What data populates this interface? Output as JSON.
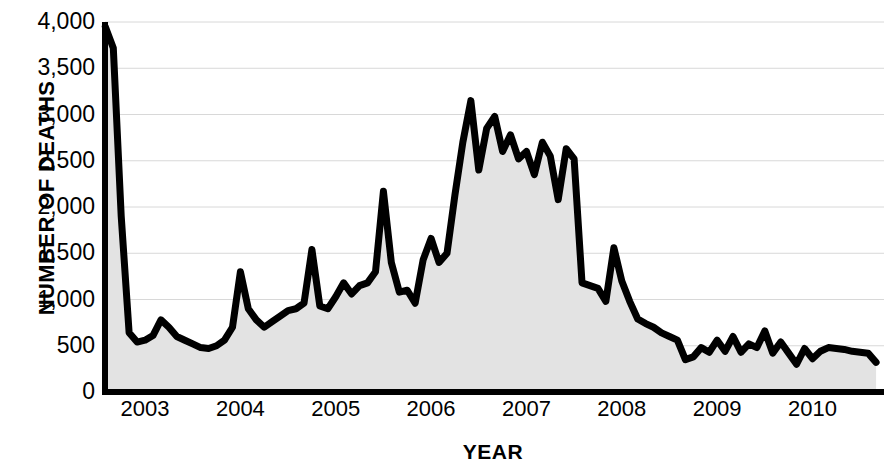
{
  "chart_data": {
    "type": "area",
    "title": "",
    "xlabel": "YEAR",
    "ylabel": "NUMBER OF DEATHS",
    "xlim": [
      2002.58,
      2010.75
    ],
    "ylim": [
      0,
      4000
    ],
    "yticks": [
      0,
      500,
      1000,
      1500,
      2000,
      2500,
      3000,
      3500,
      4000
    ],
    "ytick_labels": [
      "0",
      "500",
      "1,000",
      "1,500",
      "2,000",
      "2,500",
      "3,000",
      "3,500",
      "4,000"
    ],
    "xticks": [
      2003,
      2004,
      2005,
      2006,
      2007,
      2008,
      2009,
      2010
    ],
    "xtick_labels": [
      "2003",
      "2004",
      "2005",
      "2006",
      "2007",
      "2008",
      "2009",
      "2010"
    ],
    "grid": "horizontal",
    "line_color": "#000000",
    "fill_color": "#e3e3e3",
    "line_width": 7,
    "series": [
      {
        "name": "Number of deaths",
        "x": [
          2002.583,
          2002.667,
          2002.75,
          2002.833,
          2002.917,
          2003.0,
          2003.083,
          2003.167,
          2003.25,
          2003.333,
          2003.417,
          2003.5,
          2003.583,
          2003.667,
          2003.75,
          2003.833,
          2003.917,
          2004.0,
          2004.083,
          2004.167,
          2004.25,
          2004.333,
          2004.417,
          2004.5,
          2004.583,
          2004.667,
          2004.75,
          2004.833,
          2004.917,
          2005.0,
          2005.083,
          2005.167,
          2005.25,
          2005.333,
          2005.417,
          2005.5,
          2005.583,
          2005.667,
          2005.75,
          2005.833,
          2005.917,
          2006.0,
          2006.083,
          2006.167,
          2006.25,
          2006.333,
          2006.417,
          2006.5,
          2006.583,
          2006.667,
          2006.75,
          2006.833,
          2006.917,
          2007.0,
          2007.083,
          2007.167,
          2007.25,
          2007.333,
          2007.417,
          2007.5,
          2007.583,
          2007.667,
          2007.75,
          2007.833,
          2007.917,
          2008.0,
          2008.083,
          2008.167,
          2008.25,
          2008.333,
          2008.417,
          2008.5,
          2008.583,
          2008.667,
          2008.75,
          2008.833,
          2008.917,
          2009.0,
          2009.083,
          2009.167,
          2009.25,
          2009.333,
          2009.417,
          2009.5,
          2009.583,
          2009.667,
          2009.75,
          2009.833,
          2009.917,
          2010.0,
          2010.083,
          2010.167,
          2010.25,
          2010.333,
          2010.417,
          2010.5,
          2010.583,
          2010.667
        ],
        "values": [
          3950,
          3720,
          1900,
          640,
          540,
          560,
          610,
          780,
          700,
          600,
          560,
          520,
          480,
          470,
          500,
          560,
          700,
          1300,
          900,
          780,
          700,
          760,
          820,
          880,
          900,
          960,
          1540,
          930,
          900,
          1030,
          1180,
          1060,
          1150,
          1180,
          1300,
          2170,
          1400,
          1080,
          1100,
          960,
          1430,
          1660,
          1400,
          1500,
          2130,
          2700,
          3150,
          2400,
          2850,
          2980,
          2600,
          2780,
          2520,
          2600,
          2350,
          2700,
          2550,
          2080,
          2630,
          2520,
          1180,
          1150,
          1120,
          980,
          1560,
          1200,
          980,
          790,
          740,
          700,
          640,
          600,
          560,
          350,
          380,
          480,
          430,
          560,
          440,
          600,
          430,
          520,
          480,
          660,
          420,
          540,
          420,
          300,
          470,
          360,
          440,
          480,
          470,
          460,
          440,
          430,
          420,
          320
        ]
      }
    ]
  },
  "axes": {
    "y_title": "NUMBER OF DEATHS",
    "x_title": "YEAR"
  }
}
